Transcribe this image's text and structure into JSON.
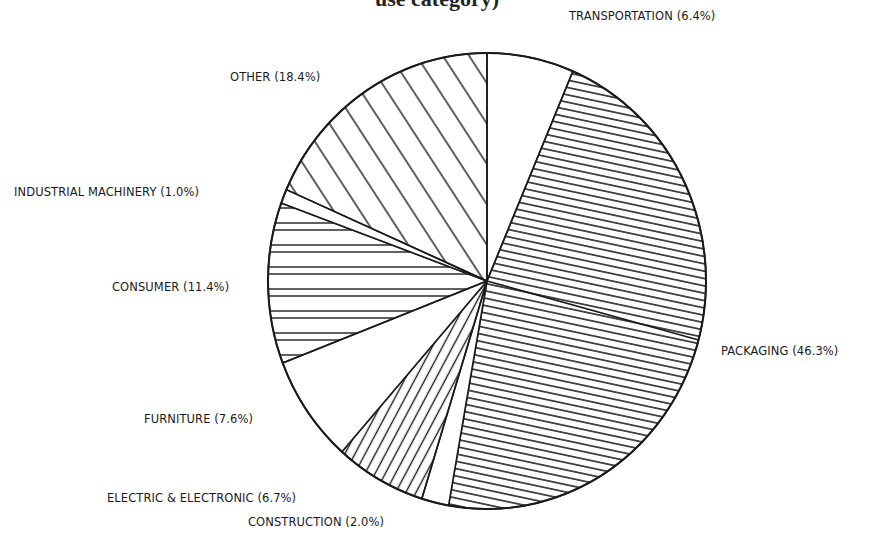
{
  "chart_data": {
    "type": "pie",
    "title": "use category)",
    "start_angle_deg": 0,
    "direction": "clockwise",
    "slices": [
      {
        "label": "TRANSPORTATION",
        "value": 6.4,
        "pattern": "none"
      },
      {
        "label": "PACKAGING",
        "value": 46.3,
        "pattern": "dense-horizontal"
      },
      {
        "label": "CONSTRUCTION",
        "value": 2.0,
        "pattern": "none"
      },
      {
        "label": "ELECTRIC & ELECTRONIC",
        "value": 6.7,
        "pattern": "diagonal-steep"
      },
      {
        "label": "FURNITURE",
        "value": 7.6,
        "pattern": "none"
      },
      {
        "label": "CONSUMER",
        "value": 11.4,
        "pattern": "horizontal"
      },
      {
        "label": "INDUSTRIAL MACHINERY",
        "value": 1.0,
        "pattern": "none"
      },
      {
        "label": "OTHER",
        "value": 18.4,
        "pattern": "diagonal"
      }
    ],
    "unit": "%"
  },
  "labels": {
    "transportation": "TRANSPORTATION (6.4%)",
    "packaging": "PACKAGING (46.3%)",
    "construction": "CONSTRUCTION (2.0%)",
    "electric": "ELECTRIC & ELECTRONIC (6.7%)",
    "furniture": "FURNITURE (7.6%)",
    "consumer": "CONSUMER (11.4%)",
    "industrial": "INDUSTRIAL MACHINERY (1.0%)",
    "other": "OTHER (18.4%)"
  },
  "colors": {
    "ink": "#1a1a1a",
    "background": "#ffffff"
  }
}
